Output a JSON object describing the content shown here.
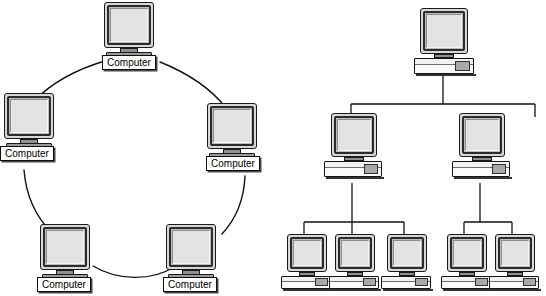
{
  "diagram": {
    "background_color": "#ffffff",
    "line_color": "#111111",
    "panels": [
      {
        "id": "ring",
        "name": "Ring topology",
        "node_count": 5,
        "link_style": "curved-arc"
      },
      {
        "id": "tree",
        "name": "Tree / hierarchical topology",
        "node_count": 7,
        "link_style": "orthogonal-elbow"
      }
    ]
  },
  "icon_colors": {
    "bezel": "#2b2b2b",
    "screen": "#e3e3e3",
    "monitor_shell": "#d8d8d8",
    "base": "#9a9a9a",
    "case_front": "#fbfbfb",
    "drive_bay": "#a9a9a9",
    "outline": "#111111",
    "label_fill": "#ffffff"
  },
  "ring": {
    "label_text": "Computer",
    "nodes": [
      {
        "id": "ring-top",
        "label": "Computer",
        "x": 100,
        "y": 2,
        "w": 56,
        "angle_deg": 90
      },
      {
        "id": "ring-left",
        "label": "Computer",
        "x": 0,
        "y": 93,
        "w": 56,
        "angle_deg": 162
      },
      {
        "id": "ring-right",
        "label": "Computer",
        "x": 203,
        "y": 103,
        "w": 56,
        "angle_deg": 18
      },
      {
        "id": "ring-bottom-left",
        "label": "Computer",
        "x": 36,
        "y": 224,
        "w": 56,
        "angle_deg": 234
      },
      {
        "id": "ring-bottom-right",
        "label": "Computer",
        "x": 162,
        "y": 224,
        "w": 56,
        "angle_deg": 306
      }
    ],
    "links": [
      {
        "from": "ring-top",
        "to": "ring-left"
      },
      {
        "from": "ring-top",
        "to": "ring-right"
      },
      {
        "from": "ring-left",
        "to": "ring-bottom-left"
      },
      {
        "from": "ring-right",
        "to": "ring-bottom-right"
      },
      {
        "from": "ring-bottom-left",
        "to": "ring-bottom-right"
      }
    ]
  },
  "tree": {
    "levels": 3,
    "nodes": [
      {
        "id": "tree-root",
        "level": 0,
        "x": 139,
        "y": 8,
        "w": 62,
        "label": ""
      },
      {
        "id": "tree-mid-l",
        "level": 1,
        "x": 50,
        "y": 113,
        "w": 58,
        "label": ""
      },
      {
        "id": "tree-mid-r",
        "level": 1,
        "x": 178,
        "y": 113,
        "w": 58,
        "label": ""
      },
      {
        "id": "tree-leaf-1",
        "level": 2,
        "x": 12,
        "y": 231,
        "w": 50,
        "label": ""
      },
      {
        "id": "tree-leaf-2",
        "level": 2,
        "x": 60,
        "y": 231,
        "w": 50,
        "label": ""
      },
      {
        "id": "tree-leaf-3",
        "level": 2,
        "x": 108,
        "y": 231,
        "w": 50,
        "label": ""
      },
      {
        "id": "tree-leaf-4",
        "level": 2,
        "x": 172,
        "y": 231,
        "w": 50,
        "label": ""
      },
      {
        "id": "tree-leaf-5",
        "level": 2,
        "x": 220,
        "y": 231,
        "w": 50,
        "label": ""
      }
    ],
    "links": [
      {
        "from": "tree-root",
        "to": "tree-mid-l"
      },
      {
        "from": "tree-root",
        "to": "tree-mid-r"
      },
      {
        "from": "tree-mid-l",
        "to": "tree-leaf-1"
      },
      {
        "from": "tree-mid-l",
        "to": "tree-leaf-2"
      },
      {
        "from": "tree-mid-l",
        "to": "tree-leaf-3"
      },
      {
        "from": "tree-mid-r",
        "to": "tree-leaf-4"
      },
      {
        "from": "tree-mid-r",
        "to": "tree-leaf-5"
      }
    ]
  }
}
